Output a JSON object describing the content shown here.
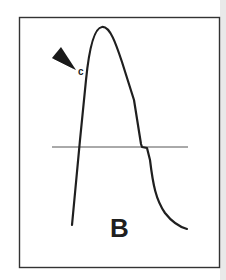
{
  "figure": {
    "panel_label": "B",
    "marker_label": "c",
    "colors": {
      "stroke": "#1f1f1f",
      "baseline": "#555555",
      "frame": "#333333",
      "background": "#ffffff",
      "edge": "#e9e9e9"
    }
  }
}
